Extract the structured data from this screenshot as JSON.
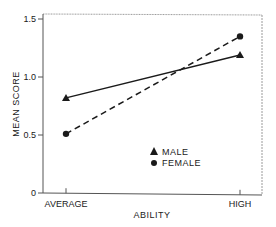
{
  "chart_data": {
    "type": "line",
    "title": "",
    "xlabel": "ABILITY",
    "ylabel": "MEAN SCORE",
    "categories": [
      "AVERAGE",
      "HIGH"
    ],
    "series": [
      {
        "name": "MALE",
        "marker": "triangle",
        "line_style": "solid",
        "values": [
          0.82,
          1.19
        ]
      },
      {
        "name": "FEMALE",
        "marker": "circle",
        "line_style": "dashed",
        "values": [
          0.51,
          1.35
        ]
      }
    ],
    "ylim": [
      0,
      1.55
    ],
    "yticks": [
      0,
      0.5,
      1.0,
      1.5
    ],
    "ytick_labels": [
      "0",
      "0.5",
      "1.0",
      "1.5"
    ],
    "grid": false,
    "legend_position": "lower center inside plot"
  },
  "colors": {
    "ink": "#1a1a1a",
    "frame": "#9a9a9a",
    "background": "#ffffff"
  }
}
